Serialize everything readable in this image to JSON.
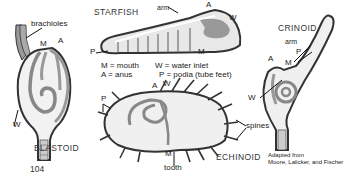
{
  "figures": {
    "blastoid": {
      "title": "BLASTOID",
      "labels": {
        "brachioles": "brachioles",
        "M": "M",
        "A": "A",
        "W": "W"
      }
    },
    "starfish": {
      "title": "STARFISH",
      "labels": {
        "arm": "arm",
        "A": "A",
        "W": "W",
        "P": "P",
        "M": "M"
      }
    },
    "crinoid": {
      "title": "CRINOID",
      "labels": {
        "arm": "arm",
        "P": "P",
        "A": "A",
        "M": "M",
        "W": "W"
      }
    },
    "echinoid": {
      "title": "ECHINOID",
      "labels": {
        "P": "P",
        "A": "A",
        "W": "W",
        "spines": "spines",
        "M": "M",
        "tooth": "tooth"
      }
    }
  },
  "legend": {
    "row1_left": "M = mouth",
    "row1_right": "W = water inlet",
    "row2_left": "A = anus",
    "row2_right": "P = podia (tube feet)"
  },
  "credit": {
    "line1": "Adapted from",
    "line2": "Moore, Lalicker, and Fischer"
  },
  "page_number": "104",
  "colors": {
    "outline": "#333333",
    "gut": "#8a8a8a",
    "body_fill": "#f0f0f0",
    "wall": "#b5b5b5"
  }
}
